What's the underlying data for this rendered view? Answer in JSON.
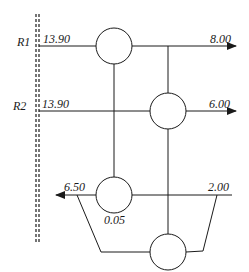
{
  "diagram": {
    "colors": {
      "stroke": "#1a1a1a",
      "background": "#ffffff"
    },
    "boundary": {
      "style": "double-dashed-vertical"
    },
    "rows": [
      {
        "id": "R1",
        "label": "R1",
        "input_value": "13.90",
        "output_value": "8.00"
      },
      {
        "id": "R2",
        "label": "R2",
        "input_value": "13.90",
        "output_value": "6.00"
      }
    ],
    "bottom_stream": {
      "left_value": "6.50",
      "right_value": "2.00",
      "node_value": "0.05"
    },
    "nodes": [
      {
        "id": "node-1",
        "shape": "circle"
      },
      {
        "id": "node-2",
        "shape": "circle"
      },
      {
        "id": "node-3",
        "shape": "circle"
      },
      {
        "id": "node-4",
        "shape": "circle"
      }
    ]
  }
}
